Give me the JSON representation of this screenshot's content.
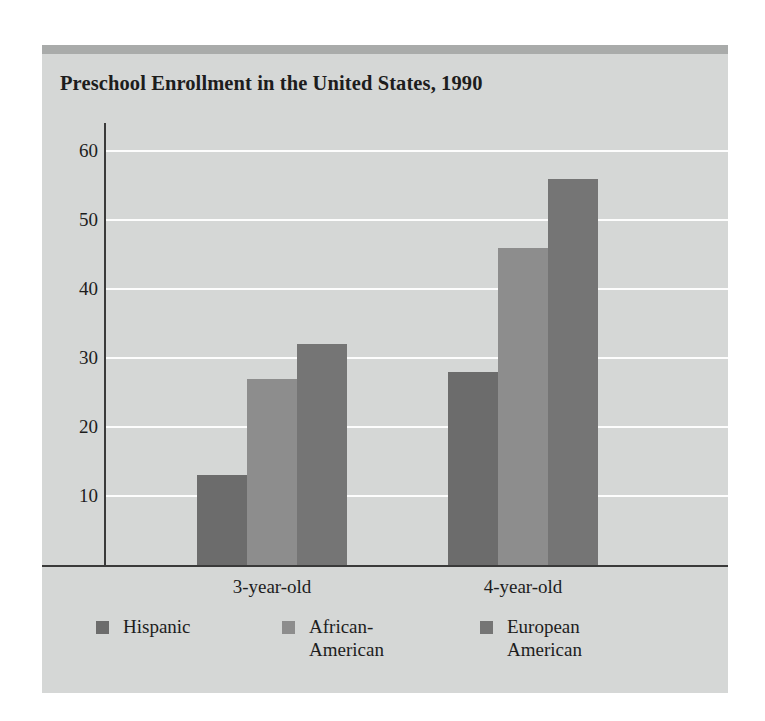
{
  "chart_data": {
    "type": "bar",
    "title": "Preschool Enrollment in the United States, 1990",
    "xlabel": "",
    "ylabel": "",
    "categories": [
      "3-year-old",
      "4-year-old"
    ],
    "series": [
      {
        "name": "Hispanic",
        "values": [
          13,
          28
        ],
        "color": "#6c6c6c"
      },
      {
        "name": "African-American",
        "values": [
          27,
          46
        ],
        "color": "#8d8d8d"
      },
      {
        "name": "European American",
        "values": [
          32,
          56
        ],
        "color": "#757575"
      }
    ],
    "ylim": [
      0,
      65
    ],
    "yticks": [
      10,
      20,
      30,
      40,
      50,
      60
    ],
    "ytick_labels": [
      "10",
      "20",
      "30",
      "40",
      "50",
      "60"
    ],
    "grid": true,
    "grid_color": "#fdfdfd",
    "legend_position": "bottom",
    "legend_labels": [
      "Hispanic",
      "African-\nAmerican",
      "European\nAmerican"
    ],
    "background_color": "#d5d7d6",
    "axis_color": "#3a3a3a"
  },
  "figure": {
    "top_band_color": "#a9abaa",
    "page_background": "#ffffff"
  }
}
